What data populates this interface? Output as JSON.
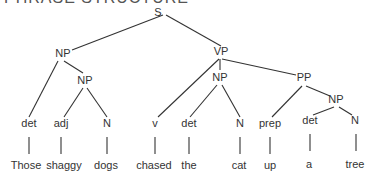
{
  "title": "PHRASE STRUCTURE",
  "tree": {
    "nodes": [
      {
        "id": "S",
        "label": "S",
        "x": 158,
        "y": 16
      },
      {
        "id": "NP1",
        "label": "NP",
        "x": 63,
        "y": 57
      },
      {
        "id": "NP2",
        "label": "NP",
        "x": 85,
        "y": 84
      },
      {
        "id": "VP",
        "label": "VP",
        "x": 221,
        "y": 55
      },
      {
        "id": "NP3",
        "label": "NP",
        "x": 220,
        "y": 81
      },
      {
        "id": "PP",
        "label": "PP",
        "x": 304,
        "y": 81
      },
      {
        "id": "NP4",
        "label": "NP",
        "x": 336,
        "y": 103
      },
      {
        "id": "det1",
        "label": "det",
        "x": 29,
        "y": 127
      },
      {
        "id": "adj1",
        "label": "adj",
        "x": 61,
        "y": 127
      },
      {
        "id": "N1",
        "label": "N",
        "x": 107,
        "y": 127
      },
      {
        "id": "v1",
        "label": "v",
        "x": 155,
        "y": 127
      },
      {
        "id": "det2",
        "label": "det",
        "x": 189,
        "y": 127
      },
      {
        "id": "N2",
        "label": "N",
        "x": 240,
        "y": 127
      },
      {
        "id": "prep1",
        "label": "prep",
        "x": 270,
        "y": 127
      },
      {
        "id": "det3",
        "label": "det",
        "x": 310,
        "y": 124
      },
      {
        "id": "N3",
        "label": "N",
        "x": 355,
        "y": 124
      },
      {
        "id": "w1",
        "label": "Those",
        "x": 26,
        "y": 169
      },
      {
        "id": "w2",
        "label": "shaggy",
        "x": 64,
        "y": 169
      },
      {
        "id": "w3",
        "label": "dogs",
        "x": 106,
        "y": 169
      },
      {
        "id": "w4",
        "label": "chased",
        "x": 154,
        "y": 169
      },
      {
        "id": "w5",
        "label": "the",
        "x": 189,
        "y": 169
      },
      {
        "id": "w6",
        "label": "cat",
        "x": 239,
        "y": 169
      },
      {
        "id": "w7",
        "label": "up",
        "x": 270,
        "y": 169
      },
      {
        "id": "w8",
        "label": "a",
        "x": 309,
        "y": 168
      },
      {
        "id": "w9",
        "label": "tree",
        "x": 355,
        "y": 168
      }
    ],
    "edges": [
      [
        163,
        15,
        72,
        50
      ],
      [
        166,
        15,
        221,
        46
      ],
      [
        58,
        61,
        29,
        117
      ],
      [
        64,
        61,
        83,
        73
      ],
      [
        83,
        88,
        64,
        117
      ],
      [
        87,
        88,
        107,
        117
      ],
      [
        219,
        59,
        158,
        117
      ],
      [
        220,
        59,
        220,
        70
      ],
      [
        222,
        59,
        296,
        75
      ],
      [
        217,
        85,
        190,
        117
      ],
      [
        222,
        85,
        240,
        117
      ],
      [
        302,
        86,
        272,
        117
      ],
      [
        306,
        86,
        330,
        96
      ],
      [
        334,
        107,
        313,
        115
      ],
      [
        339,
        107,
        352,
        115
      ],
      [
        29,
        137,
        29,
        154
      ],
      [
        61,
        137,
        61,
        154
      ],
      [
        107,
        137,
        107,
        154
      ],
      [
        155,
        137,
        155,
        154
      ],
      [
        189,
        137,
        189,
        154
      ],
      [
        240,
        137,
        240,
        154
      ],
      [
        270,
        137,
        270,
        154
      ],
      [
        310,
        134,
        310,
        151
      ],
      [
        356,
        134,
        356,
        151
      ]
    ]
  }
}
